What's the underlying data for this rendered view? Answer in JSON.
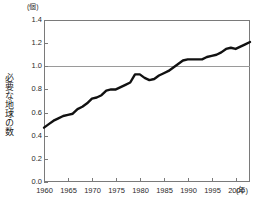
{
  "chart_data": {
    "type": "line",
    "title": "",
    "subtitle": "",
    "xlabel": "(年)",
    "ylabel": "必要な地球の数",
    "yunit": "(個)",
    "xlim": [
      1960,
      2003
    ],
    "ylim": [
      0.0,
      1.4
    ],
    "y_ticks": [
      "1.4",
      "1.2",
      "1.0",
      "0.8",
      "0.6",
      "0.4",
      "0.2",
      "0.0"
    ],
    "y_tick_values": [
      1.4,
      1.2,
      1.0,
      0.8,
      0.6,
      0.4,
      0.2,
      0.0
    ],
    "x_ticks": [
      "1960",
      "1965",
      "1970",
      "1975",
      "1980",
      "1985",
      "1990",
      "1995",
      "2000"
    ],
    "x_tick_values": [
      1960,
      1965,
      1970,
      1975,
      1980,
      1985,
      1990,
      1995,
      2000
    ],
    "gridlines": {
      "horizontal_at": [
        1.0
      ],
      "vertical": false
    },
    "legend": {
      "entries": [],
      "position": "none"
    },
    "line_color": "#111111",
    "grid_color": "#9a9a9a",
    "axis_color": "#7a7a7a",
    "x": [
      1960,
      1961,
      1962,
      1963,
      1964,
      1965,
      1966,
      1967,
      1968,
      1969,
      1970,
      1971,
      1972,
      1973,
      1974,
      1975,
      1976,
      1977,
      1978,
      1979,
      1980,
      1981,
      1982,
      1983,
      1984,
      1985,
      1986,
      1987,
      1988,
      1989,
      1990,
      1991,
      1992,
      1993,
      1994,
      1995,
      1996,
      1997,
      1998,
      1999,
      2000,
      2001,
      2002,
      2003
    ],
    "values": [
      0.47,
      0.5,
      0.53,
      0.55,
      0.57,
      0.58,
      0.59,
      0.63,
      0.65,
      0.68,
      0.72,
      0.73,
      0.75,
      0.79,
      0.8,
      0.8,
      0.82,
      0.84,
      0.86,
      0.93,
      0.93,
      0.9,
      0.88,
      0.89,
      0.92,
      0.94,
      0.96,
      0.99,
      1.02,
      1.05,
      1.06,
      1.06,
      1.06,
      1.06,
      1.08,
      1.09,
      1.1,
      1.12,
      1.15,
      1.16,
      1.15,
      1.17,
      1.19,
      1.21
    ],
    "series": [
      {
        "name": "必要な地球の数",
        "values": [
          0.47,
          0.5,
          0.53,
          0.55,
          0.57,
          0.58,
          0.59,
          0.63,
          0.65,
          0.68,
          0.72,
          0.73,
          0.75,
          0.79,
          0.8,
          0.8,
          0.82,
          0.84,
          0.86,
          0.93,
          0.93,
          0.9,
          0.88,
          0.89,
          0.92,
          0.94,
          0.96,
          0.99,
          1.02,
          1.05,
          1.06,
          1.06,
          1.06,
          1.06,
          1.08,
          1.09,
          1.1,
          1.12,
          1.15,
          1.16,
          1.15,
          1.17,
          1.19,
          1.21
        ]
      }
    ]
  }
}
